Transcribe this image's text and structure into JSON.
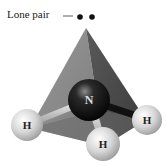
{
  "diagram": {
    "lone_pair_label": "Lone pair",
    "central_atom": {
      "symbol": "N",
      "color": "#111111"
    },
    "atoms": [
      {
        "symbol": "H",
        "position": "left"
      },
      {
        "symbol": "H",
        "position": "front"
      },
      {
        "symbol": "H",
        "position": "right"
      }
    ],
    "colors": {
      "pyramid_light": "#8a8a8a",
      "pyramid_dark": "#4a4a4a",
      "pyramid_base": "#6a6a6a",
      "hydrogen": "#d8d8d8",
      "nitrogen": "#111111",
      "lone_pair_dot": "#111111"
    }
  }
}
